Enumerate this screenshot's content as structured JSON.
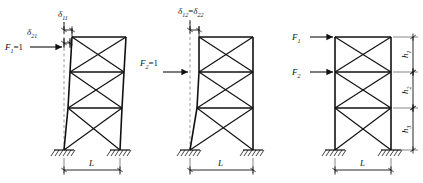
{
  "figure": {
    "panels": [
      {
        "id": "panel-1",
        "name": "unit-load-at-top",
        "load_label": "F",
        "load_sub": "1",
        "load_value": "=1",
        "span_label": "L",
        "deflections": [
          {
            "symbol": "δ",
            "sub": "11",
            "position": "top"
          },
          {
            "symbol": "δ",
            "sub": "21",
            "position": "middle"
          }
        ],
        "support": "fixed",
        "stories": 3,
        "bracing": "x-braced",
        "deformed": true
      },
      {
        "id": "panel-2",
        "name": "unit-load-at-mid",
        "load_label": "F",
        "load_sub": "2",
        "load_value": "=1",
        "span_label": "L",
        "deflections": [
          {
            "symbol": "δ",
            "sub": "12",
            "position": "top"
          },
          {
            "symbol": "δ",
            "sub": "22",
            "position": "top"
          }
        ],
        "deflection_relation": "=",
        "support": "fixed",
        "stories": 3,
        "bracing": "x-braced",
        "deformed": true
      },
      {
        "id": "panel-3",
        "name": "applied-forces-and-heights",
        "forces": [
          {
            "symbol": "F",
            "sub": "1",
            "level": "top"
          },
          {
            "symbol": "F",
            "sub": "2",
            "level": "second"
          }
        ],
        "span_label": "L",
        "heights": [
          {
            "symbol": "h",
            "sub": "1",
            "story": "top"
          },
          {
            "symbol": "h",
            "sub": "2",
            "story": "middle"
          },
          {
            "symbol": "h",
            "sub": "3",
            "story": "bottom"
          }
        ],
        "support": "fixed",
        "stories": 3,
        "bracing": "x-braced",
        "deformed": false
      }
    ],
    "colors": {
      "line": "#111111",
      "dashed": "#999999",
      "dimension": "#555555",
      "background": "#ffffff"
    }
  }
}
